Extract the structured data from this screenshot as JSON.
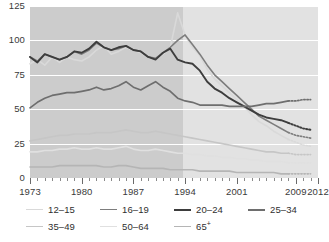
{
  "chart_data": {
    "type": "line",
    "title": "",
    "subtitle": "",
    "xlabel": "",
    "ylabel": "",
    "xlim": [
      1973,
      2012
    ],
    "ylim": [
      0,
      125
    ],
    "yticks": [
      0,
      25,
      50,
      75,
      100,
      125
    ],
    "xticks": [
      1973,
      1980,
      1987,
      1994,
      2001,
      2009,
      2012
    ],
    "grid": true,
    "legend_position": "bottom",
    "shaded_regions": [
      {
        "from": 1973,
        "to": 1994,
        "color": "#cccccc"
      },
      {
        "from": 1994,
        "to": 2012,
        "color": "#e2e2e2"
      }
    ],
    "x": [
      1973,
      1974,
      1975,
      1976,
      1977,
      1978,
      1979,
      1980,
      1981,
      1982,
      1983,
      1984,
      1985,
      1986,
      1987,
      1988,
      1989,
      1990,
      1991,
      1992,
      1993,
      1994,
      1995,
      1996,
      1997,
      1998,
      1999,
      2000,
      2001,
      2002,
      2003,
      2004,
      2005,
      2006,
      2007,
      2008,
      2009,
      2010,
      2011
    ],
    "dashed_from": 2008,
    "series": [
      {
        "name": "12-15",
        "color": "#d9d9d9",
        "width": 1.6,
        "values": [
          83,
          86,
          82,
          88,
          84,
          88,
          86,
          85,
          88,
          93,
          96,
          90,
          92,
          95,
          93,
          91,
          88,
          86,
          90,
          95,
          120,
          104,
          95,
          89,
          79,
          72,
          67,
          62,
          57,
          52,
          46,
          41,
          38,
          34,
          31,
          28,
          26,
          24,
          23
        ]
      },
      {
        "name": "16-19",
        "color": "#7d7d7d",
        "width": 1.6,
        "values": [
          88,
          85,
          90,
          88,
          86,
          88,
          92,
          90,
          93,
          98,
          95,
          93,
          94,
          96,
          93,
          92,
          88,
          87,
          91,
          95,
          100,
          104,
          97,
          90,
          82,
          75,
          70,
          65,
          60,
          55,
          50,
          45,
          42,
          39,
          36,
          33,
          31,
          30,
          29
        ]
      },
      {
        "name": "20-24",
        "color": "#3d3d3d",
        "width": 1.9,
        "values": [
          88,
          84,
          90,
          88,
          86,
          88,
          92,
          91,
          94,
          99,
          95,
          93,
          95,
          96,
          93,
          92,
          88,
          86,
          91,
          94,
          86,
          84,
          83,
          78,
          70,
          65,
          62,
          58,
          55,
          52,
          49,
          46,
          44,
          43,
          42,
          40,
          38,
          36,
          35
        ]
      },
      {
        "name": "25-34",
        "color": "#6e6e6e",
        "width": 1.7,
        "values": [
          51,
          55,
          58,
          60,
          61,
          62,
          62,
          63,
          64,
          66,
          64,
          65,
          67,
          70,
          66,
          64,
          67,
          70,
          66,
          63,
          58,
          56,
          55,
          53,
          53,
          53,
          53,
          52,
          52,
          52,
          52,
          53,
          54,
          54,
          55,
          56,
          56,
          57,
          57
        ]
      },
      {
        "name": "35-49",
        "color": "#c6c6c6",
        "width": 1.6,
        "values": [
          27,
          28,
          29,
          30,
          31,
          31,
          32,
          32,
          32,
          33,
          33,
          33,
          34,
          35,
          34,
          33,
          33,
          34,
          33,
          32,
          31,
          30,
          29,
          28,
          27,
          26,
          25,
          24,
          23,
          22,
          21,
          20,
          19,
          19,
          18,
          18,
          17,
          17,
          17
        ]
      },
      {
        "name": "50-64",
        "color": "#e0e0e0",
        "width": 1.6,
        "values": [
          19,
          19,
          20,
          20,
          21,
          21,
          22,
          21,
          21,
          22,
          21,
          21,
          22,
          23,
          21,
          20,
          20,
          21,
          20,
          19,
          18,
          18,
          17,
          17,
          16,
          16,
          15,
          15,
          14,
          14,
          13,
          13,
          12,
          12,
          12,
          11,
          11,
          11,
          11
        ]
      },
      {
        "name": "65+",
        "color": "#b5b5b5",
        "width": 1.6,
        "values": [
          8,
          8,
          8,
          8,
          9,
          9,
          9,
          9,
          9,
          9,
          8,
          8,
          9,
          9,
          8,
          7,
          7,
          7,
          7,
          6,
          6,
          6,
          6,
          5,
          5,
          5,
          5,
          5,
          4,
          4,
          4,
          4,
          4,
          4,
          3,
          3,
          3,
          3,
          3
        ]
      }
    ]
  },
  "legend": {
    "rows": [
      [
        {
          "label": "12–15",
          "color": "#d9d9d9",
          "width": 1.6
        },
        {
          "label": "16–19",
          "color": "#7d7d7d",
          "width": 1.8
        },
        {
          "label": "20–24",
          "color": "#3d3d3d",
          "width": 2.2
        },
        {
          "label": "25–34",
          "color": "#6e6e6e",
          "width": 2.0
        }
      ],
      [
        {
          "label": "35–49",
          "color": "#c6c6c6",
          "width": 1.8
        },
        {
          "label": "50–64",
          "color": "#e0e0e0",
          "width": 1.8
        },
        {
          "label": "65",
          "sup": "+",
          "color": "#b5b5b5",
          "width": 1.8
        }
      ]
    ]
  }
}
